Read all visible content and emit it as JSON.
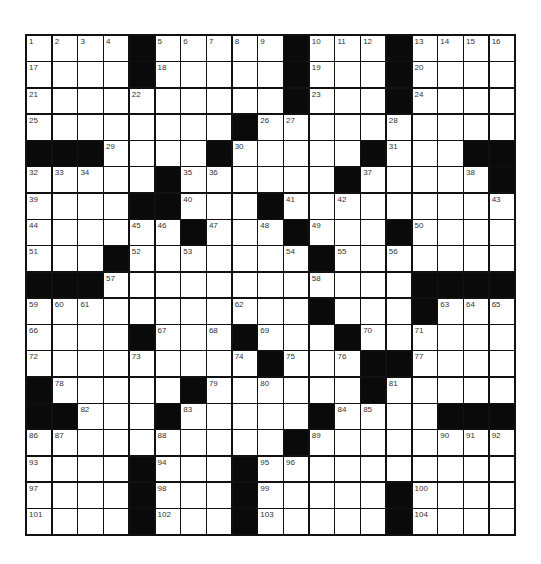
{
  "puzzle": {
    "rows": 19,
    "cols": 19,
    "colors": {
      "block": "#0a0a0a",
      "cell": "#ffffff",
      "border": "#111111",
      "number": "#333333"
    },
    "layout": [
      "....#.....#...#....",
      "....#.....#...#....",
      "..........#...#....",
      "........#..........",
      "###....#.....#...##",
      ".....#......#.....#",
      "....##...#.........",
      "......#...#...#....",
      "...#.......#.......",
      "###............####",
      "...........#...#...",
      "....#...#...#......",
      ".........#...##....",
      "#.....#......#.....",
      "##...#.....#....###",
      "..........#........",
      "....#...#..........",
      "....#...#.....#....",
      "....#...#.....#...."
    ],
    "numbers": [
      [
        1,
        0,
        0
      ],
      [
        2,
        0,
        1
      ],
      [
        3,
        0,
        2
      ],
      [
        4,
        0,
        3
      ],
      [
        5,
        0,
        5
      ],
      [
        6,
        0,
        6
      ],
      [
        7,
        0,
        7
      ],
      [
        8,
        0,
        8
      ],
      [
        9,
        0,
        9
      ],
      [
        10,
        0,
        11
      ],
      [
        11,
        0,
        12
      ],
      [
        12,
        0,
        13
      ],
      [
        13,
        0,
        15
      ],
      [
        14,
        0,
        16
      ],
      [
        15,
        0,
        17
      ],
      [
        16,
        0,
        18
      ],
      [
        17,
        1,
        0
      ],
      [
        18,
        1,
        5
      ],
      [
        19,
        1,
        11
      ],
      [
        20,
        1,
        15
      ],
      [
        21,
        2,
        0
      ],
      [
        22,
        2,
        4
      ],
      [
        23,
        2,
        11
      ],
      [
        24,
        2,
        15
      ],
      [
        25,
        3,
        0
      ],
      [
        26,
        3,
        9
      ],
      [
        27,
        3,
        10
      ],
      [
        28,
        3,
        14
      ],
      [
        29,
        4,
        3
      ],
      [
        30,
        4,
        8
      ],
      [
        31,
        4,
        14
      ],
      [
        32,
        5,
        0
      ],
      [
        33,
        5,
        1
      ],
      [
        34,
        5,
        2
      ],
      [
        35,
        5,
        6
      ],
      [
        36,
        5,
        7
      ],
      [
        37,
        5,
        13
      ],
      [
        38,
        5,
        17
      ],
      [
        39,
        6,
        0
      ],
      [
        40,
        6,
        6
      ],
      [
        41,
        6,
        10
      ],
      [
        42,
        6,
        12
      ],
      [
        43,
        6,
        18
      ],
      [
        44,
        7,
        0
      ],
      [
        45,
        7,
        4
      ],
      [
        46,
        7,
        5
      ],
      [
        47,
        7,
        7
      ],
      [
        48,
        7,
        9
      ],
      [
        49,
        7,
        11
      ],
      [
        50,
        7,
        15
      ],
      [
        51,
        8,
        0
      ],
      [
        52,
        8,
        4
      ],
      [
        53,
        8,
        6
      ],
      [
        54,
        8,
        10
      ],
      [
        55,
        8,
        12
      ],
      [
        56,
        8,
        14
      ],
      [
        57,
        9,
        3
      ],
      [
        58,
        9,
        11
      ],
      [
        59,
        10,
        0
      ],
      [
        60,
        10,
        1
      ],
      [
        61,
        10,
        2
      ],
      [
        62,
        10,
        8
      ],
      [
        63,
        10,
        16
      ],
      [
        64,
        10,
        17
      ],
      [
        65,
        10,
        18
      ],
      [
        66,
        11,
        0
      ],
      [
        67,
        11,
        5
      ],
      [
        68,
        11,
        7
      ],
      [
        69,
        11,
        9
      ],
      [
        70,
        11,
        13
      ],
      [
        71,
        11,
        15
      ],
      [
        72,
        12,
        0
      ],
      [
        73,
        12,
        4
      ],
      [
        74,
        12,
        8
      ],
      [
        75,
        12,
        10
      ],
      [
        76,
        12,
        12
      ],
      [
        77,
        12,
        15
      ],
      [
        78,
        13,
        1
      ],
      [
        79,
        13,
        7
      ],
      [
        80,
        13,
        9
      ],
      [
        81,
        13,
        14
      ],
      [
        82,
        14,
        2
      ],
      [
        83,
        14,
        6
      ],
      [
        84,
        14,
        12
      ],
      [
        85,
        14,
        13
      ],
      [
        86,
        15,
        0
      ],
      [
        87,
        15,
        1
      ],
      [
        88,
        15,
        5
      ],
      [
        89,
        15,
        11
      ],
      [
        90,
        15,
        16
      ],
      [
        91,
        15,
        17
      ],
      [
        92,
        15,
        18
      ],
      [
        93,
        16,
        0
      ],
      [
        94,
        16,
        5
      ],
      [
        95,
        16,
        9
      ],
      [
        96,
        16,
        10
      ],
      [
        97,
        17,
        0
      ],
      [
        98,
        17,
        5
      ],
      [
        99,
        17,
        9
      ],
      [
        100,
        17,
        15
      ],
      [
        101,
        18,
        0
      ],
      [
        102,
        18,
        5
      ],
      [
        103,
        18,
        9
      ],
      [
        104,
        18,
        15
      ]
    ]
  }
}
